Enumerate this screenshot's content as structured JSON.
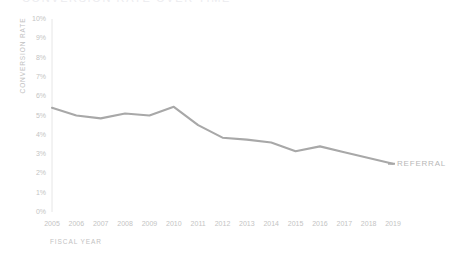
{
  "chart_data": {
    "type": "line",
    "title": "CONVERSION RATE OVER TIME",
    "xlabel": "FISCAL YEAR",
    "ylabel": "CONVERSION RATE",
    "categories": [
      "2005",
      "2006",
      "2007",
      "2008",
      "2009",
      "2010",
      "2011",
      "2012",
      "2013",
      "2014",
      "2015",
      "2016",
      "2017",
      "2018",
      "2019"
    ],
    "ytick_labels": [
      "10%",
      "9%",
      "8%",
      "7%",
      "6%",
      "5%",
      "4%",
      "3%",
      "2%",
      "1%",
      "0%"
    ],
    "ytick_values": [
      10,
      9,
      8,
      7,
      6,
      5,
      4,
      3,
      2,
      1,
      0
    ],
    "ylim": [
      0,
      10
    ],
    "grid": false,
    "legend_position": "right-inline",
    "series": [
      {
        "name": "REFERRAL",
        "color": "#a8a8a8",
        "values": [
          5.4,
          5.0,
          4.85,
          5.1,
          5.0,
          5.45,
          4.5,
          3.85,
          3.75,
          3.6,
          3.15,
          3.4,
          3.1,
          2.8,
          2.5
        ]
      }
    ]
  },
  "colors": {
    "series": "#a8a8a8",
    "axis": "#e2e2e2",
    "tick_text": "#c4c4c4",
    "axis_title": "#c2c2c2",
    "title": "#ececef",
    "background": "#ffffff"
  }
}
